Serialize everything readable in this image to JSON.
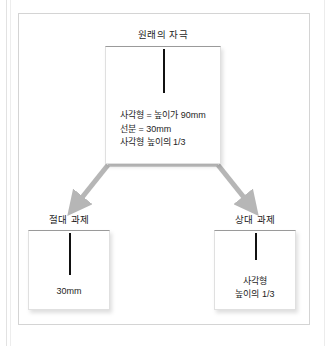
{
  "figure": {
    "type": "flow-diagram",
    "nodes": {
      "original": {
        "title": "원래의 자극",
        "description_lines": [
          "사각형 = 높이가 90mm",
          "선분 = 30mm",
          "사각형 높이의 1/3"
        ]
      },
      "absolute": {
        "title": "절대 과제",
        "caption_lines": [
          "30mm"
        ]
      },
      "relative": {
        "title": "상대 과제",
        "caption_lines": [
          "사각형",
          "높이의 1/3"
        ]
      }
    },
    "arrows": [
      {
        "name": "arrow-to-absolute",
        "from": "original",
        "to": "absolute",
        "direction": "down-left"
      },
      {
        "name": "arrow-to-relative",
        "from": "original",
        "to": "relative",
        "direction": "down-right"
      }
    ],
    "colors": {
      "arrow": "#b6b6b6",
      "stimulus_line": "#111111",
      "box_border": "#e0e0e0",
      "box_top_border": "#9a9a9a",
      "frame": "#d4d4d4",
      "background": "#ffffff",
      "text": "#1e1e1e"
    }
  }
}
